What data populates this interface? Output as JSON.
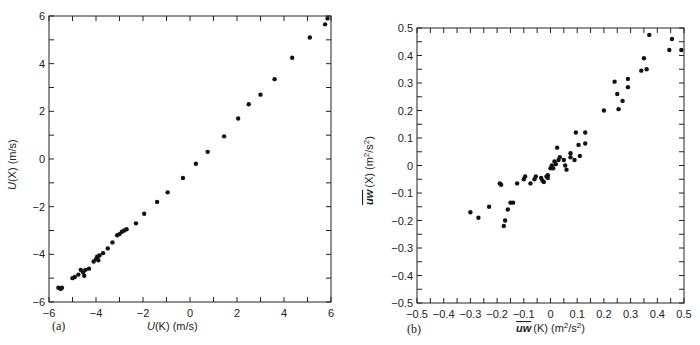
{
  "chart_data": [
    {
      "type": "scatter",
      "panel": "(a)",
      "xlabel": "U(K) (m/s)",
      "ylabel": "U(X) (m/s)",
      "xlim": [
        -6,
        6
      ],
      "ylim": [
        -6,
        6
      ],
      "xticks": [
        -6,
        -4,
        -2,
        0,
        2,
        4,
        6
      ],
      "yticks": [
        -6,
        -4,
        -2,
        0,
        2,
        4,
        6
      ],
      "xtick_labels": [
        "−6",
        "−4",
        "−2",
        "0",
        "2",
        "4",
        "6"
      ],
      "ytick_labels": [
        "−6",
        "−4",
        "−2",
        "0",
        "2",
        "4",
        "6"
      ],
      "minor_step": 1,
      "grid": false,
      "x": [
        -5.6,
        -5.5,
        -5.45,
        -5.0,
        -4.9,
        -4.75,
        -4.65,
        -4.55,
        -4.5,
        -4.45,
        -4.3,
        -4.1,
        -4.0,
        -3.95,
        -3.9,
        -3.85,
        -3.7,
        -3.5,
        -3.3,
        -3.1,
        -3.0,
        -2.9,
        -2.8,
        -2.7,
        -2.3,
        -1.95,
        -1.4,
        -0.95,
        -0.3,
        0.25,
        0.75,
        1.45,
        2.05,
        2.5,
        3.0,
        3.6,
        4.35,
        5.1,
        5.75,
        5.85
      ],
      "y": [
        -5.4,
        -5.45,
        -5.4,
        -5.0,
        -4.95,
        -4.85,
        -4.65,
        -4.75,
        -4.9,
        -4.65,
        -4.6,
        -4.3,
        -4.2,
        -4.1,
        -4.25,
        -4.05,
        -3.95,
        -3.75,
        -3.5,
        -3.2,
        -3.15,
        -3.05,
        -3.0,
        -2.95,
        -2.7,
        -2.3,
        -1.8,
        -1.4,
        -0.8,
        -0.2,
        0.3,
        0.95,
        1.7,
        2.3,
        2.7,
        3.35,
        4.25,
        5.1,
        5.65,
        5.9
      ]
    },
    {
      "type": "scatter",
      "panel": "(b)",
      "xlabel": "uw(K) (m²/s²)",
      "ylabel": "uw(X) (m²/s²)",
      "overline_symbol": "uw",
      "xlim": [
        -0.5,
        0.5
      ],
      "ylim": [
        -0.5,
        0.5
      ],
      "xticks": [
        -0.5,
        -0.4,
        -0.3,
        -0.2,
        -0.1,
        0,
        0.1,
        0.2,
        0.3,
        0.4,
        0.5
      ],
      "yticks": [
        -0.5,
        -0.4,
        -0.3,
        -0.2,
        -0.1,
        0,
        0.1,
        0.2,
        0.3,
        0.4,
        0.5
      ],
      "xtick_labels": [
        "−0.5",
        "−0.4",
        "−0.3",
        "−0.2",
        "−0.1",
        "0",
        "0.1",
        "0.2",
        "0.3",
        "0.4",
        "0.5"
      ],
      "ytick_labels": [
        "−0.5",
        "−0.4",
        "−0.3",
        "−0.2",
        "−0.1",
        "0",
        "0.1",
        "0.2",
        "0.3",
        "0.4",
        "0.5"
      ],
      "minor_step": 0.05,
      "grid": false,
      "x": [
        -0.3,
        -0.27,
        -0.23,
        -0.19,
        -0.185,
        -0.175,
        -0.17,
        -0.16,
        -0.15,
        -0.14,
        -0.125,
        -0.1,
        -0.095,
        -0.075,
        -0.06,
        -0.055,
        -0.035,
        -0.03,
        -0.025,
        -0.015,
        -0.01,
        -0.01,
        0.0,
        0.005,
        0.01,
        0.015,
        0.02,
        0.025,
        0.03,
        0.035,
        0.05,
        0.055,
        0.06,
        0.075,
        0.075,
        0.09,
        0.095,
        0.105,
        0.11,
        0.13,
        0.13,
        0.2,
        0.24,
        0.25,
        0.255,
        0.27,
        0.29,
        0.29,
        0.34,
        0.35,
        0.36,
        0.37,
        0.445,
        0.455,
        0.49
      ],
      "y": [
        -0.17,
        -0.19,
        -0.15,
        -0.065,
        -0.07,
        -0.22,
        -0.2,
        -0.16,
        -0.135,
        -0.135,
        -0.065,
        -0.05,
        -0.04,
        -0.065,
        -0.05,
        -0.04,
        -0.045,
        -0.055,
        -0.06,
        -0.04,
        -0.035,
        -0.045,
        -0.01,
        0.0,
        -0.01,
        0.015,
        0.005,
        0.065,
        0.02,
        0.03,
        0.02,
        0.0,
        -0.015,
        0.045,
        0.03,
        0.02,
        0.12,
        0.075,
        0.035,
        0.08,
        0.12,
        0.2,
        0.305,
        0.26,
        0.205,
        0.235,
        0.285,
        0.315,
        0.345,
        0.39,
        0.35,
        0.475,
        0.42,
        0.46,
        0.42
      ]
    }
  ],
  "panels": {
    "a": {
      "label": "(a)",
      "xlabel_italic": "U",
      "xlabel_rest": "(K) (m/s)",
      "ylabel_italic": "U",
      "ylabel_rest": "(X) (m/s)"
    },
    "b": {
      "label": "(b)",
      "xlabel_symbol": "uw",
      "xlabel_rest": "(K) (m",
      "ylabel_symbol": "uw",
      "ylabel_rest": "(X) (m",
      "sup2": "2",
      "slash_s": "/s",
      "close": ")"
    }
  }
}
